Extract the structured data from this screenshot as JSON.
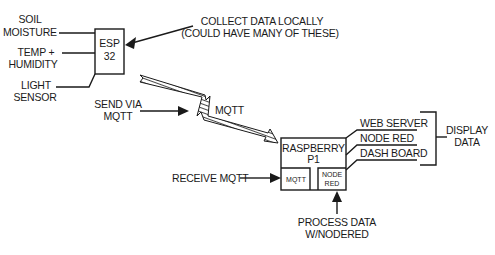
{
  "diagram": {
    "esp": {
      "line1": "ESP",
      "line2": "32"
    },
    "sensors": {
      "soil": [
        "SOIL",
        "MOISTURE"
      ],
      "temp": [
        "TEMP +",
        "HUMIDITY"
      ],
      "light": [
        "LIGHT",
        "SENSOR"
      ]
    },
    "collect_note": [
      "COLLECT DATA LOCALLY",
      "(COULD HAVE MANY OF THESE)"
    ],
    "send_note": [
      "SEND VIA",
      "MQTT"
    ],
    "link_label": "MQTT",
    "rpi": {
      "line1": "RASPBERRY",
      "line2": "P1",
      "mqtt_module": "MQTT",
      "nodered_module": [
        "NODE",
        "RED"
      ]
    },
    "receive_note": "RECEIVE MQTT",
    "process_note": [
      "PROCESS DATA",
      "W/NODERED"
    ],
    "outputs": [
      "WEB SERVER",
      "NODE RED",
      "DASH BOARD"
    ],
    "display_note": [
      "DISPLAY",
      "DATA"
    ],
    "colors": {
      "ink": "#1a1a1a",
      "background": "#ffffff"
    }
  }
}
